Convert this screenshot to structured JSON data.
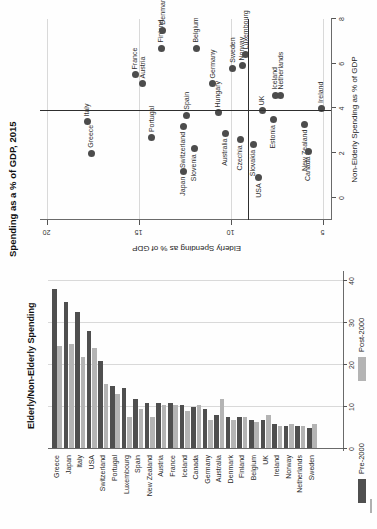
{
  "figure": {
    "orientation_note": "landscape figure rotated 90deg CCW on portrait page",
    "bar_panel_title": "Elderly/Non-Elderly Spending",
    "scatter_panel_title": "Spending as a % of GDP, 2015",
    "legend": {
      "pre_label": "Pre-2000",
      "post_label": "Post-2000"
    },
    "colors": {
      "pre_2000": "#4f4f4f",
      "post_2000": "#b4b4b4",
      "dot": "#4c4c4c",
      "grid": "#d9d9d9",
      "axis": "#6a6a6a",
      "reference_line": "#2e2e2e"
    }
  },
  "chart_data": [
    {
      "type": "bar",
      "orientation": "horizontal",
      "title": "Elderly/Non-Elderly Spending",
      "categories": [
        "Greece",
        "Japan",
        "Italy",
        "USA",
        "Switzerland",
        "Portugal",
        "Luxembourg",
        "Spain",
        "New Zealand",
        "Austria",
        "France",
        "Iceland",
        "Canada",
        "Germany",
        "Australia",
        "Denmark",
        "Finland",
        "Belgium",
        "UK",
        "Ireland",
        "Norway",
        "Netherlands",
        "Sweden"
      ],
      "series": [
        {
          "name": "Pre-2000",
          "values": [
            38,
            35,
            32.5,
            28,
            21,
            15,
            14.5,
            12,
            11,
            11,
            11,
            10.5,
            10,
            9.5,
            8,
            7.5,
            7.5,
            7,
            7,
            6,
            5.5,
            5.5,
            5
          ]
        },
        {
          "name": "Post-2000",
          "values": [
            24.5,
            25,
            22,
            24,
            15.5,
            13,
            7.5,
            9.5,
            7.5,
            10.5,
            10.5,
            9,
            10.5,
            7,
            12,
            7,
            7.5,
            6.5,
            8,
            5.5,
            6,
            5.5,
            6
          ]
        }
      ],
      "xlabel": "",
      "xlim": [
        0,
        40
      ],
      "xticks": [
        0,
        10,
        20,
        30,
        40
      ],
      "grid": true,
      "legend_position": "bottom"
    },
    {
      "type": "scatter",
      "title": "Spending as a % of GDP, 2015",
      "xlabel": "Non-Elderly Spending as % of GDP",
      "ylabel": "Elderly Spending as % of GDP",
      "xlim": [
        0,
        8
      ],
      "ylim": [
        5,
        20
      ],
      "xticks": [
        0,
        2,
        4,
        6,
        8
      ],
      "yticks": [
        20,
        15,
        10,
        5
      ],
      "reference_x": 3.9,
      "reference_y": 9.1,
      "points": [
        {
          "label": "Greece",
          "elderly": 17.6,
          "non_elderly": 2.0,
          "side": "r"
        },
        {
          "label": "Italy",
          "elderly": 17.8,
          "non_elderly": 3.4,
          "side": "r"
        },
        {
          "label": "France",
          "elderly": 15.2,
          "non_elderly": 5.5,
          "side": "r"
        },
        {
          "label": "Austria",
          "elderly": 14.8,
          "non_elderly": 5.1,
          "side": "r"
        },
        {
          "label": "Portugal",
          "elderly": 14.3,
          "non_elderly": 2.7,
          "side": "r"
        },
        {
          "label": "Finland",
          "elderly": 13.8,
          "non_elderly": 6.7,
          "side": "r"
        },
        {
          "label": "Denmark",
          "elderly": 13.7,
          "non_elderly": 7.5,
          "side": "r"
        },
        {
          "label": "Japan",
          "elderly": 12.6,
          "non_elderly": 1.2,
          "side": "l"
        },
        {
          "label": "Switzerland",
          "elderly": 12.6,
          "non_elderly": 3.2,
          "side": "l"
        },
        {
          "label": "Spain",
          "elderly": 12.4,
          "non_elderly": 3.7,
          "side": "r"
        },
        {
          "label": "Slovenia",
          "elderly": 12.0,
          "non_elderly": 2.2,
          "side": "l"
        },
        {
          "label": "Belgium",
          "elderly": 11.9,
          "non_elderly": 6.7,
          "side": "r"
        },
        {
          "label": "Germany",
          "elderly": 11.0,
          "non_elderly": 5.1,
          "side": "r"
        },
        {
          "label": "Hungary",
          "elderly": 10.7,
          "non_elderly": 3.8,
          "side": "r"
        },
        {
          "label": "Australia",
          "elderly": 10.3,
          "non_elderly": 2.9,
          "side": "l"
        },
        {
          "label": "Sweden",
          "elderly": 9.9,
          "non_elderly": 5.8,
          "side": "r"
        },
        {
          "label": "Norway",
          "elderly": 9.4,
          "non_elderly": 5.9,
          "side": "r"
        },
        {
          "label": "Luxembourg",
          "elderly": 9.2,
          "non_elderly": 6.4,
          "side": "r"
        },
        {
          "label": "Czechia",
          "elderly": 9.5,
          "non_elderly": 2.6,
          "side": "l"
        },
        {
          "label": "Slovakia",
          "elderly": 8.8,
          "non_elderly": 2.4,
          "side": "l"
        },
        {
          "label": "USA",
          "elderly": 8.5,
          "non_elderly": 0.9,
          "side": "l"
        },
        {
          "label": "UK",
          "elderly": 8.3,
          "non_elderly": 3.9,
          "side": "r"
        },
        {
          "label": "Estonia",
          "elderly": 7.7,
          "non_elderly": 3.5,
          "side": "l"
        },
        {
          "label": "Iceland",
          "elderly": 7.6,
          "non_elderly": 4.6,
          "side": "r"
        },
        {
          "label": "Netherlands",
          "elderly": 7.3,
          "non_elderly": 4.6,
          "side": "r"
        },
        {
          "label": "New Zealand",
          "elderly": 6.0,
          "non_elderly": 3.3,
          "side": "l"
        },
        {
          "label": "Canada",
          "elderly": 5.8,
          "non_elderly": 2.1,
          "side": "l"
        },
        {
          "label": "Ireland",
          "elderly": 5.1,
          "non_elderly": 4.0,
          "side": "r"
        }
      ],
      "grid": "y-only",
      "legend_position": "none"
    }
  ]
}
